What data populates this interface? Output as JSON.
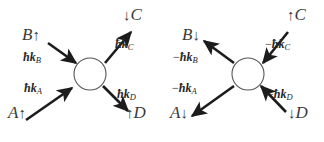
{
  "figure": {
    "background_color": "#ffffff",
    "ink_color": "#262626",
    "width": 324,
    "height": 142
  },
  "panels": [
    {
      "id": "left",
      "name": "incoming-momentum-diagram",
      "vertex": {
        "name": "interaction-vertex",
        "cx": 90,
        "cy": 74,
        "r": 16
      },
      "particles": [
        {
          "id": "A",
          "label": "A",
          "spin_arrow": "up",
          "x": 8,
          "y": 112
        },
        {
          "id": "B",
          "label": "B",
          "spin_arrow": "up",
          "x": 22,
          "y": 34
        },
        {
          "id": "C",
          "label": "C",
          "spin_arrow": "down",
          "x": 128,
          "y": 14
        },
        {
          "id": "D",
          "label": "D",
          "spin_arrow": "up",
          "x": 131,
          "y": 112
        }
      ],
      "momenta": [
        {
          "id": "kA",
          "sign": "",
          "symbol": "ħk",
          "subscript": "A",
          "x": 24,
          "y": 88,
          "direction": "toward-vertex"
        },
        {
          "id": "kB",
          "sign": "",
          "symbol": "ħk",
          "subscript": "B",
          "x": 23,
          "y": 57,
          "direction": "toward-vertex"
        },
        {
          "id": "kC",
          "sign": "",
          "symbol": "ħk",
          "subscript": "C",
          "x": 115,
          "y": 44,
          "direction": "away-from-vertex"
        },
        {
          "id": "kD",
          "sign": "",
          "symbol": "ħk",
          "subscript": "D",
          "x": 117,
          "y": 94,
          "direction": "away-from-vertex"
        }
      ]
    },
    {
      "id": "right",
      "name": "reversed-momentum-diagram",
      "vertex": {
        "name": "interaction-vertex",
        "cx": 86,
        "cy": 74,
        "r": 16
      },
      "particles": [
        {
          "id": "A",
          "label": "A",
          "spin_arrow": "down",
          "x": 8,
          "y": 112
        },
        {
          "id": "B",
          "label": "B",
          "spin_arrow": "down",
          "x": 20,
          "y": 34
        },
        {
          "id": "C",
          "label": "C",
          "spin_arrow": "up",
          "x": 130,
          "y": 14
        },
        {
          "id": "D",
          "label": "D",
          "spin_arrow": "down",
          "x": 131,
          "y": 112
        }
      ],
      "momenta": [
        {
          "id": "kA",
          "sign": "−",
          "symbol": "ħk",
          "subscript": "A",
          "x": 12,
          "y": 88,
          "direction": "away-from-vertex"
        },
        {
          "id": "kB",
          "sign": "−",
          "symbol": "ħk",
          "subscript": "B",
          "x": 13,
          "y": 57,
          "direction": "away-from-vertex"
        },
        {
          "id": "kC",
          "sign": "−",
          "symbol": "ħk",
          "subscript": "C",
          "x": 103,
          "y": 44,
          "direction": "toward-vertex"
        },
        {
          "id": "kD",
          "sign": "−",
          "symbol": "ħk",
          "subscript": "D",
          "x": 105,
          "y": 94,
          "direction": "toward-vertex"
        }
      ]
    }
  ],
  "spin_glyphs": {
    "up": "↑",
    "down": "↓"
  }
}
